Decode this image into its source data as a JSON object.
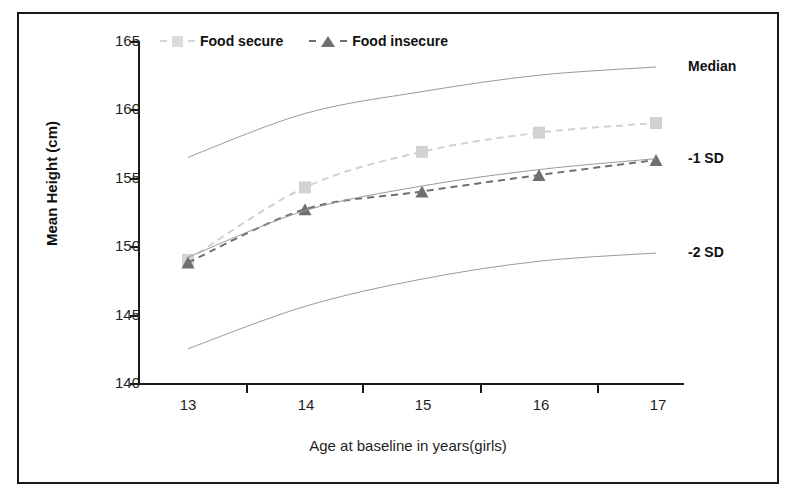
{
  "chart_data": {
    "type": "line",
    "title": "",
    "xlabel": "Age at baseline in years(girls)",
    "ylabel": "Mean Height (cm)",
    "x": [
      13,
      14,
      15,
      16,
      17
    ],
    "xtick_labels": [
      "13",
      "14",
      "15",
      "16",
      "17"
    ],
    "ytick_labels": [
      "140",
      "145",
      "150",
      "155",
      "160",
      "165"
    ],
    "ylim": [
      140,
      165
    ],
    "yticks": [
      140,
      145,
      150,
      155,
      160,
      165
    ],
    "grid": false,
    "legend_position": "top-left-inside",
    "series": [
      {
        "name": "Food secure",
        "marker": "square",
        "linestyle": "dashed",
        "color": "#d2d2d2",
        "values": [
          149.0,
          154.3,
          156.9,
          158.3,
          159.0
        ]
      },
      {
        "name": "Food insecure",
        "marker": "triangle",
        "linestyle": "dashed",
        "color": "#6f6f6f",
        "values": [
          148.8,
          152.7,
          154.0,
          155.2,
          156.3
        ]
      },
      {
        "name": "Median",
        "marker": "none",
        "linestyle": "solid",
        "color": "#9a9a9a",
        "values": [
          156.5,
          159.7,
          161.3,
          162.5,
          163.1
        ]
      },
      {
        "name": "-1 SD",
        "marker": "none",
        "linestyle": "solid",
        "color": "#9a9a9a",
        "values": [
          149.2,
          152.6,
          154.4,
          155.6,
          156.4
        ]
      },
      {
        "name": "-2 SD",
        "marker": "none",
        "linestyle": "solid",
        "color": "#9a9a9a",
        "values": [
          142.5,
          145.6,
          147.6,
          148.9,
          149.5
        ]
      }
    ],
    "annotations": [
      {
        "label": "Median",
        "at_y": 163.1
      },
      {
        "label": "-1 SD",
        "at_y": 156.4
      },
      {
        "label": "-2 SD",
        "at_y": 149.5
      }
    ]
  },
  "legend": {
    "items": [
      {
        "label": "Food secure",
        "marker": "square",
        "color": "#dcdcdc"
      },
      {
        "label": "Food insecure",
        "marker": "triangle",
        "color": "#6f6f6f"
      }
    ]
  },
  "axes": {
    "y_title": "Mean Height (cm)",
    "x_title": "Age at baseline in years(girls)",
    "y_labels": [
      "165",
      "160",
      "155",
      "150",
      "145",
      "140"
    ],
    "x_labels": [
      "13",
      "14",
      "15",
      "16",
      "17"
    ]
  },
  "annotations": {
    "median": "Median",
    "sd1": "-1 SD",
    "sd2": "-2 SD"
  },
  "colors": {
    "axis": "#1a1a1a",
    "reference_curve": "#9a9a9a",
    "food_secure": "#d2d2d2",
    "food_insecure": "#6f6f6f",
    "frame": "#1a1a1a"
  }
}
